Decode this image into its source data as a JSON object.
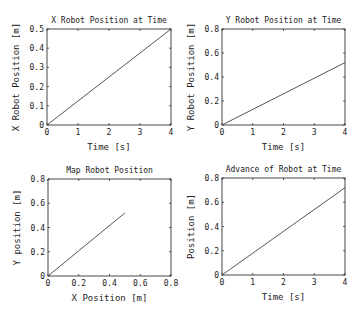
{
  "figure": {
    "width": 361,
    "height": 318,
    "background": "#ffffff",
    "line_color": "#555555"
  },
  "chart_data": [
    {
      "type": "line",
      "title": "X Robot Position at Time",
      "xlabel": "Time [s]",
      "ylabel": "X Robot Position [m]",
      "xlim": [
        0,
        4
      ],
      "ylim": [
        0,
        0.5
      ],
      "xticks": [
        "0",
        "1",
        "2",
        "3",
        "4"
      ],
      "yticks": [
        "0",
        "0.1",
        "0.2",
        "0.3",
        "0.4",
        "0.5"
      ],
      "xtick_values": [
        0,
        1,
        2,
        3,
        4
      ],
      "ytick_values": [
        0,
        0.1,
        0.2,
        0.3,
        0.4,
        0.5
      ],
      "grid": false,
      "frame": {
        "x0": 47,
        "y0": 29,
        "x1": 171,
        "y1": 125
      },
      "series": [
        {
          "name": "x",
          "x": [
            0,
            4
          ],
          "y": [
            0,
            0.5
          ]
        }
      ]
    },
    {
      "type": "line",
      "title": "Y Robot Position at Time",
      "xlabel": "Time [s]",
      "ylabel": "Y Robot Position [m]",
      "xlim": [
        0,
        4
      ],
      "ylim": [
        0,
        0.8
      ],
      "xticks": [
        "0",
        "1",
        "2",
        "3",
        "4"
      ],
      "yticks": [
        "0",
        "0.2",
        "0.4",
        "0.6",
        "0.8"
      ],
      "xtick_values": [
        0,
        1,
        2,
        3,
        4
      ],
      "ytick_values": [
        0,
        0.2,
        0.4,
        0.6,
        0.8
      ],
      "grid": false,
      "frame": {
        "x0": 222,
        "y0": 29,
        "x1": 345,
        "y1": 125
      },
      "series": [
        {
          "name": "y",
          "x": [
            0,
            4
          ],
          "y": [
            0,
            0.52
          ]
        }
      ]
    },
    {
      "type": "line",
      "title": "Map Robot Position",
      "xlabel": "X Position [m]",
      "ylabel": "Y position [m]",
      "xlim": [
        0,
        0.8
      ],
      "ylim": [
        0,
        0.8
      ],
      "xticks": [
        "0",
        "0.2",
        "0.4",
        "0.6",
        "0.8"
      ],
      "yticks": [
        "0",
        "0.2",
        "0.4",
        "0.6",
        "0.8"
      ],
      "xtick_values": [
        0,
        0.2,
        0.4,
        0.6,
        0.8
      ],
      "ytick_values": [
        0,
        0.2,
        0.4,
        0.6,
        0.8
      ],
      "grid": false,
      "frame": {
        "x0": 48,
        "y0": 179,
        "x1": 171,
        "y1": 276
      },
      "series": [
        {
          "name": "path",
          "x": [
            0,
            0.5
          ],
          "y": [
            0,
            0.52
          ]
        }
      ]
    },
    {
      "type": "line",
      "title": "Advance of Robot at Time",
      "xlabel": "Time [s]",
      "ylabel": "Position [m]",
      "xlim": [
        0,
        4
      ],
      "ylim": [
        0,
        0.8
      ],
      "xticks": [
        "0",
        "1",
        "2",
        "3",
        "4"
      ],
      "yticks": [
        "0",
        "0.2",
        "0.4",
        "0.6",
        "0.8"
      ],
      "xtick_values": [
        0,
        1,
        2,
        3,
        4
      ],
      "ytick_values": [
        0,
        0.2,
        0.4,
        0.6,
        0.8
      ],
      "grid": false,
      "frame": {
        "x0": 222,
        "y0": 178,
        "x1": 345,
        "y1": 275
      },
      "series": [
        {
          "name": "advance",
          "x": [
            0,
            4
          ],
          "y": [
            0,
            0.72
          ]
        }
      ]
    }
  ]
}
